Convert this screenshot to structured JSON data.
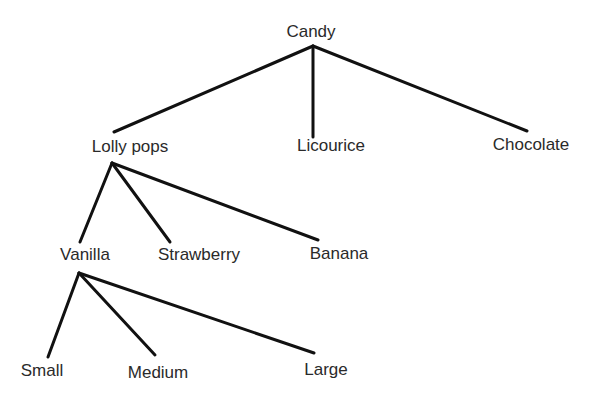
{
  "diagram": {
    "type": "tree",
    "line_color": "#111111",
    "text_color": "#2a2a2a",
    "nodes": [
      {
        "id": "candy",
        "label": "Candy",
        "x": 311,
        "y": 31
      },
      {
        "id": "lollypops",
        "label": "Lolly pops",
        "x": 130,
        "y": 146
      },
      {
        "id": "licourice",
        "label": "Licourice",
        "x": 331,
        "y": 145
      },
      {
        "id": "chocolate",
        "label": "Chocolate",
        "x": 531,
        "y": 144
      },
      {
        "id": "vanilla",
        "label": "Vanilla",
        "x": 85,
        "y": 254
      },
      {
        "id": "strawberry",
        "label": "Strawberry",
        "x": 199,
        "y": 254
      },
      {
        "id": "banana",
        "label": "Banana",
        "x": 339,
        "y": 253
      },
      {
        "id": "small",
        "label": "Small",
        "x": 42,
        "y": 370
      },
      {
        "id": "medium",
        "label": "Medium",
        "x": 158,
        "y": 372
      },
      {
        "id": "large",
        "label": "Large",
        "x": 326,
        "y": 369
      }
    ],
    "edges": [
      {
        "from": "candy",
        "to": "lollypops",
        "x1": 313,
        "y1": 46,
        "x2": 114,
        "y2": 132
      },
      {
        "from": "candy",
        "to": "licourice",
        "x1": 313,
        "y1": 46,
        "x2": 313,
        "y2": 137
      },
      {
        "from": "candy",
        "to": "chocolate",
        "x1": 313,
        "y1": 46,
        "x2": 527,
        "y2": 131
      },
      {
        "from": "lollypops",
        "to": "vanilla",
        "x1": 112,
        "y1": 163,
        "x2": 80,
        "y2": 242
      },
      {
        "from": "lollypops",
        "to": "strawberry",
        "x1": 112,
        "y1": 163,
        "x2": 170,
        "y2": 242
      },
      {
        "from": "lollypops",
        "to": "banana",
        "x1": 112,
        "y1": 163,
        "x2": 318,
        "y2": 240
      },
      {
        "from": "vanilla",
        "to": "small",
        "x1": 79,
        "y1": 273,
        "x2": 48,
        "y2": 357
      },
      {
        "from": "vanilla",
        "to": "medium",
        "x1": 79,
        "y1": 273,
        "x2": 155,
        "y2": 355
      },
      {
        "from": "vanilla",
        "to": "large",
        "x1": 79,
        "y1": 273,
        "x2": 314,
        "y2": 353
      }
    ]
  }
}
